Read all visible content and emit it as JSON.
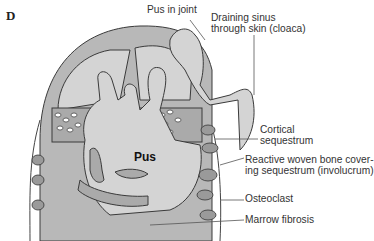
{
  "panel": {
    "letter": "D"
  },
  "center_label": "Pus",
  "labels": {
    "pus_in_joint": "Pus in joint",
    "draining_sinus_1": "Draining sinus",
    "draining_sinus_2": "through skin (cloaca)",
    "cortical_1": "Cortical",
    "cortical_2": "sequestrum",
    "reactive_1": "Reactive woven bone cover-",
    "reactive_2": "ing sequestrum (involucrum)",
    "osteoclast": "Osteoclast",
    "marrow_fibrosis": "Marrow fibrosis"
  },
  "colors": {
    "bone_gray": "#b8b8b8",
    "pus_gray": "#d4d4d4",
    "outline": "#3a3a3a",
    "background": "#ffffff"
  }
}
